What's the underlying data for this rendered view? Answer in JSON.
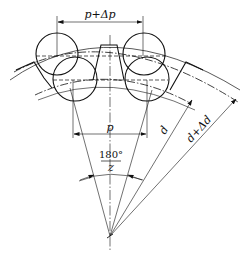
{
  "diagram": {
    "type": "gear tooth measurement with rollers (pitch and diameter deviation)",
    "labels": {
      "pitch_plus_delta": "p+Δp",
      "pitch": "p",
      "angle_numerator": "180°",
      "angle_denominator": "z",
      "diameter": "d",
      "diameter_plus_delta": "d+Δd"
    },
    "colors": {
      "line": "#111111",
      "background": "#ffffff"
    }
  }
}
